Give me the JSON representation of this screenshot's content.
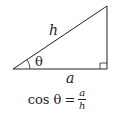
{
  "diagram": {
    "type": "right-triangle",
    "labels": {
      "hypotenuse": "h",
      "adjacent": "a",
      "angle": "θ"
    },
    "formula": {
      "lhs": "cos θ",
      "equals": "=",
      "numerator": "a",
      "denominator": "h"
    },
    "stroke_color": "#222222"
  }
}
